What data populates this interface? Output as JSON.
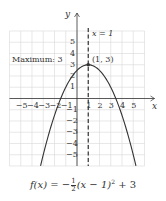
{
  "chart_data": {
    "type": "line",
    "title": "",
    "function": "f(x) = -1/2 (x - 1)^2 + 3",
    "xlabel": "x",
    "ylabel": "y",
    "xlim": [
      -6,
      6
    ],
    "ylim": [
      -6,
      6
    ],
    "grid": true,
    "x_ticks": [
      -5,
      -4,
      -3,
      -2,
      -1,
      1,
      2,
      3,
      4,
      5
    ],
    "y_ticks": [
      5,
      4,
      3,
      2,
      1,
      -1,
      -2,
      -3,
      -4,
      -5
    ],
    "series": [
      {
        "name": "f(x)",
        "x": [
          -3.24,
          -3,
          -2,
          -1.45,
          -1,
          0,
          1,
          2,
          3,
          3.45,
          4,
          5,
          5.24
        ],
        "y": [
          -6,
          -5,
          -1.5,
          0,
          1,
          2.5,
          3,
          2.5,
          1,
          0,
          -1.5,
          -5,
          -6
        ]
      }
    ],
    "axis_of_symmetry": {
      "x": 1,
      "label": "x = 1",
      "style": "dashed"
    },
    "annotations": [
      {
        "text": "Maximum: 3",
        "near": [
          -5.5,
          3
        ]
      },
      {
        "text": "(1, 3)",
        "point": [
          1,
          3
        ]
      }
    ],
    "vertex": [
      1,
      3
    ]
  },
  "labels": {
    "y_axis": "y",
    "x_axis": "x",
    "symmetry": "x = 1",
    "maximum": "Maximum: 3",
    "vertex": "(1, 3)",
    "formula_prefix": "f(x) = −",
    "formula_num": "1",
    "formula_den": "2",
    "formula_mid": "(x − 1)",
    "formula_exp": "2",
    "formula_suffix": " + 3"
  },
  "colors": {
    "grid": "#d9d9d9",
    "axis": "#333333",
    "curve": "#333333",
    "text": "#333333"
  }
}
